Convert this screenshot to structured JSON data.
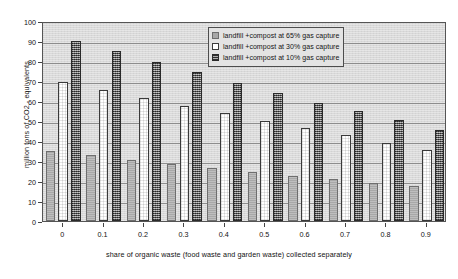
{
  "chart_data": {
    "type": "bar",
    "title": "",
    "subtitle": "",
    "xlabel": "share of organic waste (food waste and garden waste) collected separately",
    "ylabel": "million tons of CO2 - equivalents",
    "categories": [
      "0",
      "0.1",
      "0.2",
      "0.3",
      "0.4",
      "0.5",
      "0.6",
      "0.7",
      "0.8",
      "0.9"
    ],
    "ylim": [
      0,
      100
    ],
    "yticks": [
      0,
      10,
      20,
      30,
      40,
      50,
      60,
      70,
      80,
      90,
      100
    ],
    "grid": true,
    "legend_position": "top-right",
    "series": [
      {
        "name": "landfill +compost at 65% gas capture",
        "color": "#a8a8a8",
        "values": [
          35.0,
          33.0,
          30.7,
          28.6,
          26.5,
          24.7,
          22.7,
          20.8,
          19.0,
          17.5
        ]
      },
      {
        "name": "landfill +compost at 30% gas capture",
        "color": "#ffffff",
        "values": [
          69.5,
          65.5,
          61.5,
          57.7,
          53.8,
          50.2,
          46.4,
          42.8,
          39.0,
          35.4
        ]
      },
      {
        "name": "landfill +compost at 10% gas capture",
        "color": "#5e5e5e",
        "values": [
          90.0,
          84.8,
          79.7,
          74.4,
          69.2,
          64.0,
          59.0,
          54.8,
          50.3,
          45.5
        ]
      }
    ]
  },
  "legend": {
    "items": [
      {
        "label": "landfill +compost at 65% gas capture",
        "swatch": "s0"
      },
      {
        "label": "landfill +compost at 30% gas capture",
        "swatch": "s1"
      },
      {
        "label": "landfill +compost at 10% gas capture",
        "swatch": "s2"
      }
    ]
  },
  "axes": {
    "y_title": "million tons of CO2 - equivalents",
    "x_title": "share of organic waste (food waste and garden waste) collected separately"
  }
}
